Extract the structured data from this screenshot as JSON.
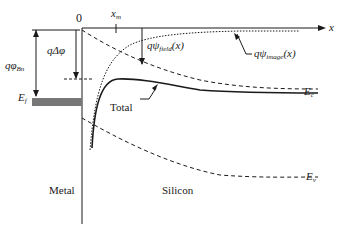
{
  "diagram": {
    "labels": {
      "origin": "0",
      "x_max": "x",
      "x_max_sub": "m",
      "x_axis": "x",
      "barrier_height": "qφ",
      "barrier_height_sub": "Bn",
      "barrier_lowering": "qΔφ",
      "fermi_level": "E",
      "fermi_level_sub": "f",
      "field_potential": "qψ",
      "field_potential_sub": "field",
      "field_potential_arg": "(x)",
      "image_potential": "qψ",
      "image_potential_sub": "image",
      "image_potential_arg": "(x)",
      "total": "Total",
      "conduction_band": "E",
      "conduction_band_sub": "c",
      "valence_band": "E",
      "valence_band_sub": "v",
      "metal_region": "Metal",
      "semiconductor_region": "Silicon"
    },
    "curves": [
      {
        "name": "field-potential",
        "style": "dashed",
        "description": "linear-ish descending from origin to Ec"
      },
      {
        "name": "image-potential",
        "style": "dotted",
        "description": "rises from deep near interface toward 0"
      },
      {
        "name": "total-energy",
        "style": "solid",
        "description": "sum; peaks at x_m"
      },
      {
        "name": "valence-band",
        "style": "dashed",
        "description": "parallel to field curve, lower"
      }
    ],
    "colors": {
      "line": "#1a1a1a",
      "fermi_fill": "#777777"
    }
  }
}
